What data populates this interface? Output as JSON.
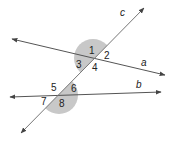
{
  "diagram": {
    "lines": [
      {
        "name": "a",
        "label": "a",
        "from": [
          12,
          39
        ],
        "to": [
          165,
          75
        ],
        "label_pos": [
          141,
          66
        ]
      },
      {
        "name": "b",
        "label": "b",
        "from": [
          10,
          97
        ],
        "to": [
          161,
          92
        ],
        "label_pos": [
          136,
          88
        ]
      },
      {
        "name": "c",
        "label": "c",
        "from": [
          21,
          133
        ],
        "to": [
          144,
          8
        ],
        "label_pos": [
          120,
          16
        ]
      }
    ],
    "intersections": [
      {
        "name": "a-c",
        "center": [
          93,
          58
        ],
        "shade_radius": 19
      },
      {
        "name": "b-c",
        "center": [
          59,
          95
        ],
        "shade_radius": 19
      }
    ],
    "angles": [
      {
        "label": "1",
        "pos": [
          89,
          54
        ]
      },
      {
        "label": "2",
        "pos": [
          104,
          59
        ]
      },
      {
        "label": "3",
        "pos": [
          76,
          68
        ]
      },
      {
        "label": "4",
        "pos": [
          92,
          71
        ]
      },
      {
        "label": "5",
        "pos": [
          51,
          91
        ]
      },
      {
        "label": "6",
        "pos": [
          71,
          92
        ]
      },
      {
        "label": "7",
        "pos": [
          41,
          105
        ]
      },
      {
        "label": "8",
        "pos": [
          59,
          107
        ]
      }
    ],
    "colors": {
      "line": "#555555",
      "shade": "#c8c8c8",
      "text": "#222222"
    }
  }
}
